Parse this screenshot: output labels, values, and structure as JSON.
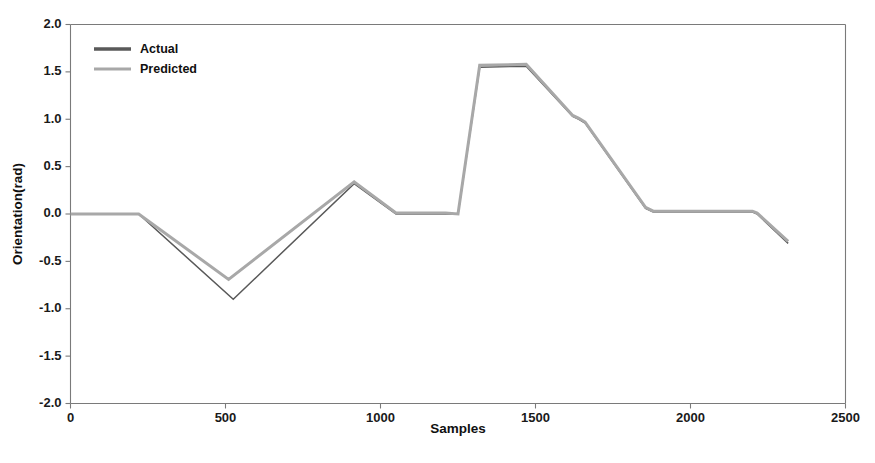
{
  "chart_data": {
    "type": "line",
    "title": "",
    "xlabel": "Samples",
    "ylabel": "Orientation(rad)",
    "xlim": [
      0,
      2500
    ],
    "ylim": [
      -2.0,
      2.0
    ],
    "xticks": [
      0,
      500,
      1000,
      1500,
      2000,
      2500
    ],
    "xticklabels": [
      "0",
      "500",
      "1000",
      "1500",
      "2000",
      "2500"
    ],
    "yticks": [
      -2.0,
      -1.5,
      -1.0,
      -0.5,
      0.0,
      0.5,
      1.0,
      1.5,
      2.0
    ],
    "yticklabels": [
      "-2.0",
      "-1.5",
      "-1.0",
      "-0.5",
      "0.0",
      "0.5",
      "1.0",
      "1.5",
      "2.0"
    ],
    "grid": false,
    "legend_position": "upper-left",
    "legend": [
      "Actual",
      "Predicted"
    ],
    "colors": {
      "actual": "#595959",
      "predicted": "#a8a8a8",
      "axis": "#7a7a7a",
      "text": "#101010"
    },
    "series": [
      {
        "name": "Actual",
        "color": "#595959",
        "points": [
          [
            0,
            0.0
          ],
          [
            220,
            0.0
          ],
          [
            525,
            -0.9
          ],
          [
            915,
            0.32
          ],
          [
            1050,
            0.0
          ],
          [
            1210,
            0.0
          ],
          [
            1250,
            0.0
          ],
          [
            1320,
            1.55
          ],
          [
            1470,
            1.56
          ],
          [
            1620,
            1.03
          ],
          [
            1640,
            1.0
          ],
          [
            1660,
            0.96
          ],
          [
            1855,
            0.06
          ],
          [
            1880,
            0.02
          ],
          [
            2200,
            0.02
          ],
          [
            2215,
            0.0
          ],
          [
            2315,
            -0.31
          ]
        ]
      },
      {
        "name": "Predicted",
        "color": "#a8a8a8",
        "points": [
          [
            0,
            0.0
          ],
          [
            220,
            0.0
          ],
          [
            510,
            -0.69
          ],
          [
            915,
            0.34
          ],
          [
            1050,
            0.01
          ],
          [
            1210,
            0.01
          ],
          [
            1250,
            0.0
          ],
          [
            1320,
            1.57
          ],
          [
            1470,
            1.58
          ],
          [
            1620,
            1.04
          ],
          [
            1640,
            1.01
          ],
          [
            1660,
            0.97
          ],
          [
            1855,
            0.07
          ],
          [
            1880,
            0.03
          ],
          [
            2200,
            0.03
          ],
          [
            2215,
            0.01
          ],
          [
            2315,
            -0.29
          ]
        ]
      }
    ]
  },
  "legend": {
    "entries": [
      {
        "label": "Actual",
        "color": "#595959"
      },
      {
        "label": "Predicted",
        "color": "#a8a8a8"
      }
    ]
  },
  "axes": {
    "x_title": "Samples",
    "y_title": "Orientation(rad)"
  }
}
